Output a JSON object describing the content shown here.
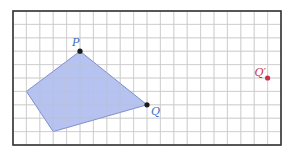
{
  "figure": {
    "grid": {
      "origin_px": [
        13,
        11
      ],
      "cell_px": 13.4,
      "cols": 20,
      "rows": 10,
      "line_color": "#c9c9c9",
      "border_color": "#333333"
    },
    "polygon": {
      "vertices": [
        [
          5,
          3
        ],
        [
          10,
          7
        ],
        [
          3,
          9
        ],
        [
          1,
          6
        ]
      ],
      "fill": "#a9b8ee",
      "stroke": "#6677c4"
    },
    "points": [
      {
        "id": "P",
        "label": "P",
        "grid": [
          5,
          3
        ],
        "color": "#1a1a1a",
        "label_color": "#3b6cc4",
        "label_offset": [
          -8,
          -5
        ]
      },
      {
        "id": "Q",
        "label": "Q",
        "grid": [
          10,
          7
        ],
        "color": "#1a1a1a",
        "label_color": "#3b6cc4",
        "label_offset": [
          4,
          10
        ]
      },
      {
        "id": "Qprime",
        "label": "Q′",
        "grid": [
          19,
          5
        ],
        "color": "#c9304d",
        "label_color": "#c9304d",
        "label_offset": [
          -13,
          -2
        ]
      }
    ],
    "labels": {
      "P": "P",
      "Q": "Q",
      "Qprime": "Q′"
    }
  }
}
